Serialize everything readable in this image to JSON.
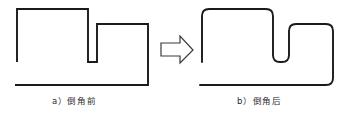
{
  "figure": {
    "background_color": "#ffffff",
    "line_color": "#1a1a1a",
    "arrow_fill": "#ffffff",
    "arrow_stroke": "#3a3a3a",
    "panels": [
      {
        "id": "panel-a",
        "caption": "a）倒角前",
        "caption_label": "a",
        "caption_body": "倒角前",
        "corner_style": "sharp",
        "path": "M 17 62 L 17 9 L 88 9 L 88 62 L 97 62 L 97 24 L 148 24 L 148 85 L 15 85",
        "segments": [
          {
            "name": "left-vertical",
            "from": [
              17,
              62
            ],
            "to": [
              17,
              9
            ]
          },
          {
            "name": "top-horizontal",
            "from": [
              17,
              9
            ],
            "to": [
              88,
              9
            ]
          },
          {
            "name": "step-down-vertical",
            "from": [
              88,
              9
            ],
            "to": [
              88,
              62
            ]
          },
          {
            "name": "notch-bottom-horizontal",
            "from": [
              88,
              62
            ],
            "to": [
              97,
              62
            ]
          },
          {
            "name": "notch-inner-vertical",
            "from": [
              97,
              62
            ],
            "to": [
              97,
              24
            ]
          },
          {
            "name": "notch-top-horizontal",
            "from": [
              97,
              24
            ],
            "to": [
              148,
              24
            ]
          },
          {
            "name": "right-vertical",
            "from": [
              148,
              24
            ],
            "to": [
              148,
              85
            ]
          },
          {
            "name": "bottom-horizontal",
            "from": [
              148,
              85
            ],
            "to": [
              15,
              85
            ]
          }
        ]
      },
      {
        "id": "panel-b",
        "caption": "b）倒角后",
        "caption_label": "b",
        "caption_body": "倒角后",
        "corner_style": "rounded",
        "corner_radius": 7,
        "path": "M 202 62 L 202 16 Q 202 9 209 9 L 266 9 Q 273 9 273 16 L 273 55 Q 273 62 280 62 L 282 62 Q 289 62 289 55 L 289 31 Q 289 24 296 24 L 326 24 Q 333 24 333 31 L 333 78 Q 333 85 326 85 L 200 85",
        "segments": [
          {
            "name": "left-vertical",
            "from": [
              202,
              62
            ],
            "to": [
              202,
              16
            ]
          },
          {
            "name": "top-horizontal",
            "from": [
              209,
              9
            ],
            "to": [
              266,
              9
            ]
          },
          {
            "name": "step-down-vertical",
            "from": [
              273,
              16
            ],
            "to": [
              273,
              55
            ]
          },
          {
            "name": "notch-bottom-horizontal",
            "from": [
              280,
              62
            ],
            "to": [
              282,
              62
            ]
          },
          {
            "name": "notch-inner-vertical",
            "from": [
              289,
              55
            ],
            "to": [
              289,
              31
            ]
          },
          {
            "name": "notch-top-horizontal",
            "from": [
              296,
              24
            ],
            "to": [
              326,
              24
            ]
          },
          {
            "name": "right-vertical",
            "from": [
              333,
              31
            ],
            "to": [
              333,
              78
            ]
          },
          {
            "name": "bottom-horizontal",
            "from": [
              326,
              85
            ],
            "to": [
              200,
              85
            ]
          }
        ]
      }
    ],
    "arrow": {
      "name": "transform-arrow",
      "direction": "right",
      "path": "M 161 43 L 180 43 L 180 36 L 193 50 L 180 63 L 180 56 L 161 56 Z"
    }
  }
}
